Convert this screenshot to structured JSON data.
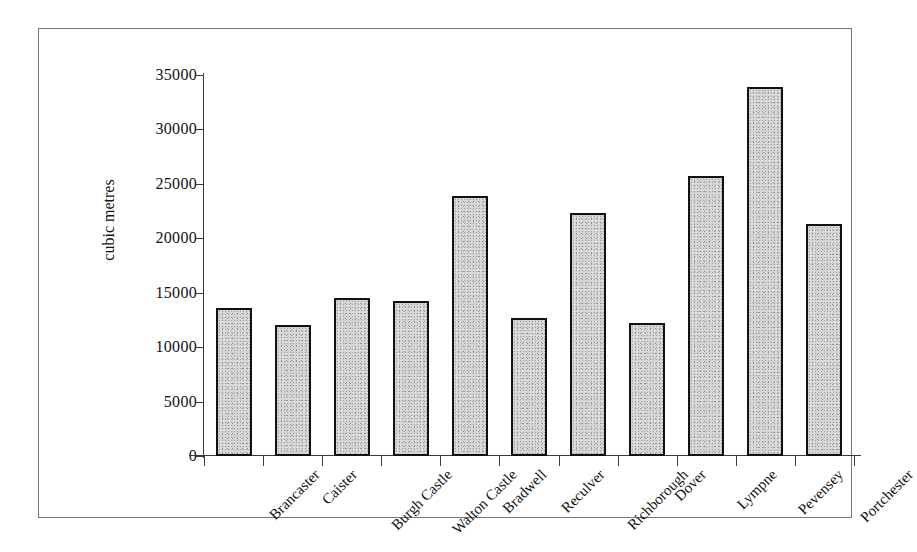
{
  "figure": {
    "background": "#ffffff",
    "frame_color": "#777777",
    "bar_fill": "#d2d2d2",
    "bar_border": "#111111",
    "axis_color": "#3a3a3a"
  },
  "chart_data": {
    "type": "bar",
    "title": "",
    "xlabel": "",
    "ylabel": "cubic metres",
    "ylim": [
      0,
      35000
    ],
    "ytick_labels": [
      "35000",
      "30000",
      "25000",
      "20000",
      "15000",
      "10000",
      "5000",
      "0"
    ],
    "ytick_values": [
      35000,
      30000,
      25000,
      20000,
      15000,
      10000,
      5000,
      0
    ],
    "grid": false,
    "legend": false,
    "categories": [
      "Brancaster",
      "Caister",
      "Burgh Castle",
      "Walton Castle",
      "Bradwell",
      "Reculver",
      "Richborough",
      "Dover",
      "Lympne",
      "Pevensey",
      "Portchester"
    ],
    "values": [
      13600,
      12000,
      14500,
      14200,
      23900,
      12700,
      22300,
      12200,
      25700,
      33900,
      21300
    ]
  }
}
